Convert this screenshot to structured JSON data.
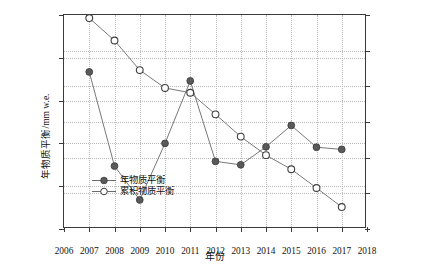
{
  "chart_data": {
    "type": "line",
    "title": "",
    "xlabel": "年份",
    "ylabel": "年物质平衡/mm w.e.",
    "ylabel_right": "累积物质平衡/mm w.e.",
    "x": [
      2007,
      2008,
      2009,
      2010,
      2011,
      2012,
      2013,
      2014,
      2015,
      2016,
      2017
    ],
    "xlim": [
      2006,
      2018
    ],
    "xticks": [
      "2006",
      "2007",
      "2008",
      "2009",
      "2010",
      "2011",
      "2012",
      "2013",
      "2014",
      "2015",
      "2016",
      "2017",
      "2018"
    ],
    "ylim": [
      -2000,
      500
    ],
    "yticks": [
      "500",
      "0",
      "-500",
      "-1000",
      "-1500",
      "-2000"
    ],
    "ylim_right": [
      -12000,
      0
    ],
    "yticks_right": [
      "0",
      "-2000",
      "-4000",
      "-6000",
      "-8000",
      "-10000",
      "-12000"
    ],
    "grid": true,
    "legend_position": "lower left",
    "series": [
      {
        "name": "年物质平衡",
        "axis": "left",
        "marker": "filled-circle",
        "color": "#5a5a5a",
        "values": [
          -165,
          -1265,
          -1660,
          -1000,
          -270,
          -1210,
          -1250,
          -1040,
          -790,
          -1045,
          -1070
        ]
      },
      {
        "name": "累积物质平衡",
        "axis": "right",
        "marker": "open-circle",
        "color": "#5a5a5a",
        "values": [
          -170,
          -1430,
          -3090,
          -4090,
          -4360,
          -5570,
          -6820,
          -7860,
          -8650,
          -9700,
          -10770
        ]
      }
    ]
  },
  "legend": {
    "items": [
      {
        "label": "年物质平衡",
        "marker": "filled-circle"
      },
      {
        "label": "累积物质平衡",
        "marker": "open-circle"
      }
    ]
  },
  "axes": {
    "x_title": "年份",
    "y_left_title": "年物质平衡/mm w.e.",
    "y_right_title": "累积物质平衡/mm w.e."
  }
}
